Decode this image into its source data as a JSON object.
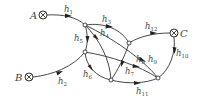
{
  "diagram": {
    "type": "flow-network",
    "terminals": [
      {
        "id": "A",
        "label": "A",
        "x": 43,
        "y": 15
      },
      {
        "id": "B",
        "label": "B",
        "x": 29,
        "y": 77
      },
      {
        "id": "C",
        "label": "C",
        "x": 174,
        "y": 33
      }
    ],
    "nodes": [
      {
        "id": "n1",
        "x": 85,
        "y": 25
      },
      {
        "id": "n2",
        "x": 85,
        "y": 52
      },
      {
        "id": "n3",
        "x": 129,
        "y": 43
      },
      {
        "id": "n4",
        "x": 111,
        "y": 80
      },
      {
        "id": "n5",
        "x": 158,
        "y": 78
      }
    ],
    "edges": [
      {
        "id": "h1",
        "base": "h",
        "sub": "1",
        "from": "A",
        "to": "n1"
      },
      {
        "id": "h2",
        "base": "h",
        "sub": "2",
        "from": "B",
        "to": "n2"
      },
      {
        "id": "h3",
        "base": "h",
        "sub": "3",
        "from": "n1",
        "to": "n3"
      },
      {
        "id": "h4",
        "base": "h",
        "sub": "4",
        "from": "n1",
        "to": "n4"
      },
      {
        "id": "h5",
        "base": "h",
        "sub": "5",
        "from": "n1",
        "to": "n2"
      },
      {
        "id": "h6",
        "base": "h",
        "sub": "6",
        "from": "n2",
        "to": "n4"
      },
      {
        "id": "h7",
        "base": "h",
        "sub": "7",
        "from": "n3",
        "to": "n4"
      },
      {
        "id": "h8",
        "base": "h",
        "sub": "8",
        "from": "n2",
        "to": "n5"
      },
      {
        "id": "h9",
        "base": "h",
        "sub": "9",
        "from": "n1",
        "to": "n5"
      },
      {
        "id": "h10",
        "base": "h",
        "sub": "10",
        "from": "C",
        "to": "n5"
      },
      {
        "id": "h11",
        "base": "h",
        "sub": "11",
        "from": "n4",
        "to": "n5"
      },
      {
        "id": "h12",
        "base": "h",
        "sub": "12",
        "from": "n3",
        "to": "C"
      }
    ]
  }
}
